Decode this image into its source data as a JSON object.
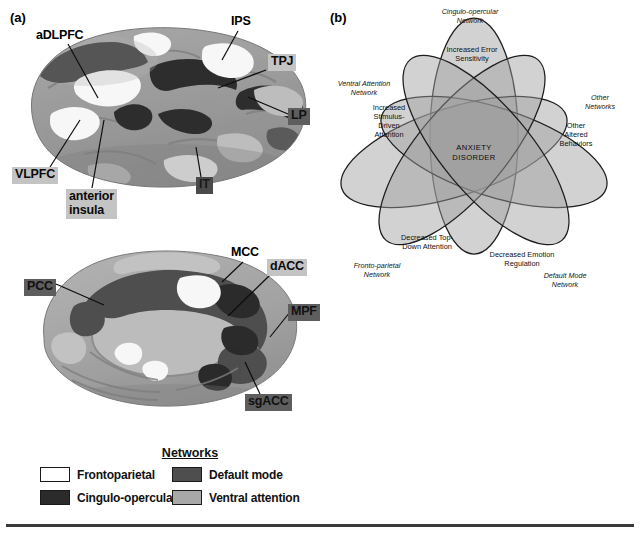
{
  "figure": {
    "top_cropped_text": "                                                                                                                                            ",
    "panel_a_letter": "(a)",
    "panel_b_letter": "(b)"
  },
  "panel_a": {
    "lateral_view": {
      "name": "lateral-brain-surface",
      "labels": [
        {
          "id": "adlpfc",
          "text": "aDLPFC",
          "style": "plain",
          "x": 33,
          "y": 28,
          "lx1": 68,
          "ly1": 44,
          "lx2": 98,
          "ly2": 98
        },
        {
          "id": "ips",
          "text": "IPS",
          "style": "plain",
          "x": 228,
          "y": 14,
          "lx1": 238,
          "ly1": 31,
          "lx2": 222,
          "ly2": 60
        },
        {
          "id": "tpj",
          "text": "TPJ",
          "style": "chip-light",
          "x": 268,
          "y": 54,
          "lx1": 266,
          "ly1": 70,
          "lx2": 218,
          "ly2": 88
        },
        {
          "id": "lp",
          "text": "LP",
          "style": "chip-dark",
          "x": 288,
          "y": 108,
          "lx1": 288,
          "ly1": 114,
          "lx2": 248,
          "ly2": 97
        },
        {
          "id": "vlpfc",
          "text": "VLPFC",
          "style": "chip-light",
          "x": 12,
          "y": 167,
          "lx1": 50,
          "ly1": 167,
          "lx2": 80,
          "ly2": 120
        },
        {
          "id": "anterior-insula",
          "text": "anterior\ninsula",
          "style": "chip-light",
          "x": 66,
          "y": 189,
          "lx1": 92,
          "ly1": 188,
          "lx2": 104,
          "ly2": 120
        },
        {
          "id": "it",
          "text": "IT",
          "style": "chip-verydark",
          "x": 196,
          "y": 177,
          "lx1": 201,
          "ly1": 177,
          "lx2": 196,
          "ly2": 147
        }
      ]
    },
    "medial_view": {
      "name": "medial-brain-surface",
      "labels": [
        {
          "id": "mcc",
          "text": "MCC",
          "style": "plain",
          "x": 228,
          "y": 245,
          "lx1": 243,
          "ly1": 262,
          "lx2": 222,
          "ly2": 282
        },
        {
          "id": "dacc",
          "text": "dACC",
          "style": "chip-light",
          "x": 267,
          "y": 259,
          "lx1": 270,
          "ly1": 275,
          "lx2": 228,
          "ly2": 316
        },
        {
          "id": "pcc",
          "text": "PCC",
          "style": "chip-dark",
          "x": 24,
          "y": 279,
          "lx1": 56,
          "ly1": 284,
          "lx2": 104,
          "ly2": 305
        },
        {
          "id": "mpf",
          "text": "MPF",
          "style": "chip-dark",
          "x": 288,
          "y": 304,
          "lx1": 290,
          "ly1": 312,
          "lx2": 270,
          "ly2": 337
        },
        {
          "id": "sgacc",
          "text": "sgACC",
          "style": "chip-dark",
          "x": 245,
          "y": 394,
          "lx1": 260,
          "ly1": 394,
          "lx2": 245,
          "ly2": 362
        }
      ]
    },
    "legend": {
      "title": "Networks",
      "entries": [
        {
          "id": "frontoparietal",
          "label": "Frontoparietal",
          "color": "#ffffff"
        },
        {
          "id": "default-mode",
          "label": "Default mode",
          "color": "#4e4e4e"
        },
        {
          "id": "cingulo-opercular",
          "label": "Cingulo-opercular",
          "color": "#2b2b2b"
        },
        {
          "id": "ventral-attention",
          "label": "Ventral attention",
          "color": "#a8a8a8"
        }
      ]
    }
  },
  "panel_b": {
    "center_label_line1": "ANXIETY",
    "center_label_line2": "DISORDER",
    "ellipses": [
      {
        "id": "cingulo-opercular",
        "network_label": [
          "Cingulo-opercular",
          "Network"
        ],
        "network_x": 148,
        "network_y": 14,
        "behavior_label": [
          "Increased Error",
          "Sensitivity"
        ],
        "behavior_x": 150,
        "behavior_y": 52,
        "cx": 152,
        "cy": 136,
        "rx": 44,
        "ry": 118,
        "rot": 0
      },
      {
        "id": "ventral-attention",
        "network_label": [
          "Ventral Attention",
          "Network"
        ],
        "network_x": 42,
        "network_y": 86,
        "behavior_label": [
          "Increased",
          "Stimulus-",
          "Driven",
          "Attention"
        ],
        "behavior_x": 67,
        "behavior_y": 110,
        "cx": 132,
        "cy": 152,
        "rx": 118,
        "ry": 44,
        "rot": -18
      },
      {
        "id": "other-networks",
        "network_label": [
          "Other",
          "Networks"
        ],
        "network_x": 278,
        "network_y": 100,
        "behavior_label": [
          "Other",
          "Altered",
          "Behaviors"
        ],
        "behavior_x": 254,
        "behavior_y": 128,
        "cx": 172,
        "cy": 152,
        "rx": 118,
        "ry": 44,
        "rot": 18
      },
      {
        "id": "fronto-parietal",
        "network_label": [
          "Fronto-parietal",
          "Network"
        ],
        "network_x": 55,
        "network_y": 268,
        "behavior_label": [
          "Decreased Top-",
          "Down Attention"
        ],
        "behavior_x": 105,
        "behavior_y": 240,
        "cx": 140,
        "cy": 150,
        "rx": 44,
        "ry": 118,
        "rot": 40
      },
      {
        "id": "default-mode",
        "network_label": [
          "Default Mode",
          "Network"
        ],
        "network_x": 243,
        "network_y": 278,
        "behavior_label": [
          "Decreased Emotion",
          "Regulation"
        ],
        "behavior_x": 200,
        "behavior_y": 257,
        "cx": 164,
        "cy": 150,
        "rx": 44,
        "ry": 118,
        "rot": -40
      }
    ]
  }
}
